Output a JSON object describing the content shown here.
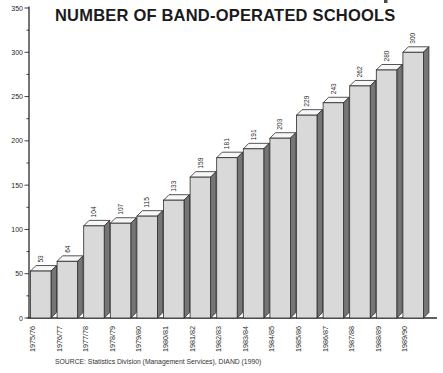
{
  "title": "NUMBER OF BAND-OPERATED SCHOOLS",
  "source": "SOURCE: Statistics Division (Management Services), DIAND (1990)",
  "chart_data": {
    "type": "bar",
    "style": "3d-column",
    "title": "NUMBER OF BAND-OPERATED SCHOOLS",
    "categories": [
      "1975/76",
      "1976/77",
      "1977/78",
      "1978/79",
      "1979/80",
      "1980/81",
      "1981/82",
      "1982/83",
      "1983/84",
      "1984/85",
      "1985/86",
      "1986/87",
      "1987/88",
      "1988/89",
      "1989/90"
    ],
    "values": [
      53,
      64,
      104,
      107,
      115,
      133,
      159,
      181,
      191,
      203,
      229,
      243,
      262,
      280,
      300
    ],
    "bar_labels_shown": true,
    "xlabel": "",
    "ylabel": "",
    "ylim": [
      0,
      350
    ],
    "ytick_step": 50,
    "ytick_minor_step": 25,
    "ytick_labels": [
      "0",
      "50",
      "100",
      "150",
      "200",
      "250",
      "300",
      "350"
    ],
    "grid": false,
    "legend": null,
    "colors": {
      "background": "#ffffff",
      "bar_front": "#d9d9d9",
      "bar_side": "#757575",
      "bar_top": "#f7f7f7",
      "outline": "#2b2b2b",
      "text": "#1f1f1f"
    }
  }
}
